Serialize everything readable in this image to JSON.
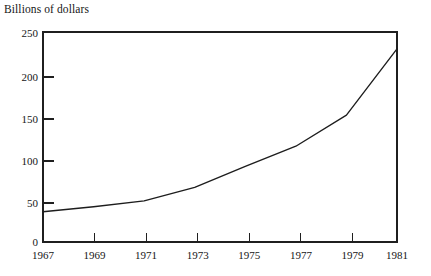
{
  "chart_data": {
    "type": "line",
    "title": "Billions of dollars",
    "subtitle": "",
    "xlabel": "",
    "ylabel": "",
    "x": [
      1967,
      1969,
      1971,
      1973,
      1975,
      1977,
      1979,
      1981
    ],
    "values": [
      36,
      42,
      49,
      65,
      90,
      114,
      151,
      230
    ],
    "series": [
      {
        "name": "Billions of dollars",
        "values": [
          36,
          42,
          49,
          65,
          90,
          114,
          151,
          230
        ]
      }
    ],
    "xlim": [
      1967,
      1981
    ],
    "ylim": [
      0,
      250
    ],
    "xticks": [
      1967,
      1969,
      1971,
      1973,
      1975,
      1977,
      1979,
      1981
    ],
    "xtick_labels": [
      "1967",
      "1969",
      "1971",
      "1973",
      "1975",
      "1977",
      "1979",
      "1981"
    ],
    "yticks": [
      0,
      50,
      100,
      150,
      200,
      250
    ],
    "ytick_labels": [
      "0",
      "50",
      "100",
      "150",
      "200",
      "250"
    ],
    "grid": false,
    "legend": false,
    "legend_position": "none",
    "line_color": "#1d1d1d",
    "background_color": "#ffffff",
    "axis_color": "#1f1f1f",
    "frame": "full-box"
  }
}
